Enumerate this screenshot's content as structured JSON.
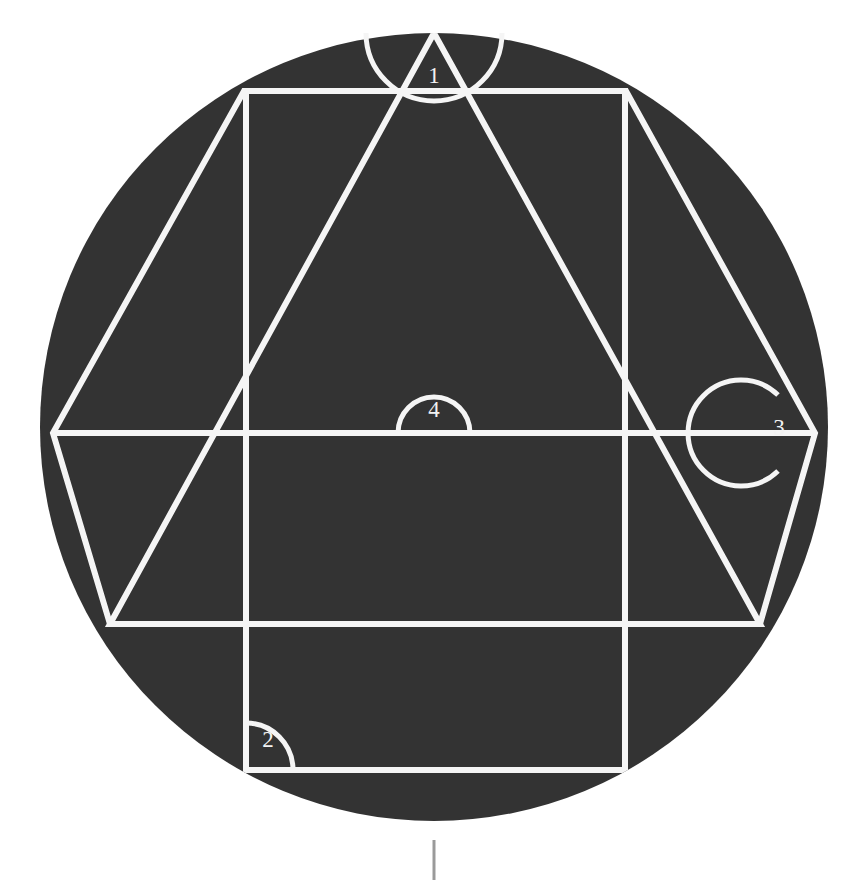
{
  "figure": {
    "background_color": "#ffffff",
    "disc_fill_color": "#333333",
    "line_color": "#f5f5f5",
    "label_color": "#f2f2f2",
    "tick_color": "#9a9a9a"
  },
  "circle": {
    "name": "circumscribed-circle",
    "center_x": 434,
    "center_y": 427,
    "radius": 394
  },
  "hexagon": {
    "name": "inscribed-hexagon",
    "vertices": [
      {
        "name": "hexagon-vertex-left",
        "x": 53,
        "y": 433
      },
      {
        "name": "hexagon-vertex-upper-left",
        "x": 244,
        "y": 91
      },
      {
        "name": "hexagon-vertex-upper-right",
        "x": 626,
        "y": 91
      },
      {
        "name": "hexagon-vertex-right",
        "x": 815,
        "y": 433
      },
      {
        "name": "hexagon-vertex-lower-right",
        "x": 760,
        "y": 624
      },
      {
        "name": "hexagon-vertex-lower-left",
        "x": 110,
        "y": 624
      }
    ]
  },
  "triangle": {
    "name": "inscribed-triangle",
    "vertices": [
      {
        "name": "triangle-apex-top",
        "x": 434,
        "y": 33
      },
      {
        "name": "triangle-vertex-bottom-left",
        "x": 110,
        "y": 624
      },
      {
        "name": "triangle-vertex-bottom-right",
        "x": 760,
        "y": 624
      }
    ]
  },
  "square": {
    "name": "inscribed-square",
    "corners": [
      {
        "name": "square-corner-top-left",
        "x": 246,
        "y": 91
      },
      {
        "name": "square-corner-top-right",
        "x": 625,
        "y": 91
      },
      {
        "name": "square-corner-bottom-right",
        "x": 625,
        "y": 770
      },
      {
        "name": "square-corner-bottom-left",
        "x": 246,
        "y": 770
      }
    ]
  },
  "diameter": {
    "name": "horizontal-diameter",
    "x1": 53,
    "y1": 433,
    "x2": 815,
    "y2": 433
  },
  "angle_markers": [
    {
      "id": "angle-marker-1",
      "label": "1",
      "label_x": 434,
      "label_y": 78,
      "arc_center_x": 434,
      "arc_center_y": 33,
      "arc_radius": 68,
      "description": "apex angle of inscribed triangle at top of circle"
    },
    {
      "id": "angle-marker-2",
      "label": "2",
      "label_x": 268,
      "label_y": 742,
      "arc_center_x": 246,
      "arc_center_y": 770,
      "arc_radius": 47,
      "description": "right angle at bottom-left corner of inscribed square"
    },
    {
      "id": "angle-marker-3",
      "label": "3",
      "label_x": 779,
      "label_y": 430,
      "arc_center_x": 815,
      "arc_center_y": 433,
      "arc_radius": 53,
      "description": "interior angle at right vertex of inscribed hexagon"
    },
    {
      "id": "angle-marker-4",
      "label": "4",
      "label_x": 434,
      "label_y": 412,
      "arc_center_x": 434,
      "arc_center_y": 433,
      "arc_radius": 36,
      "description": "straight angle on horizontal diameter at circle center"
    }
  ],
  "bottom_tick": {
    "name": "page-tick-mark",
    "x": 434,
    "y_top": 840,
    "y_bottom": 880
  }
}
